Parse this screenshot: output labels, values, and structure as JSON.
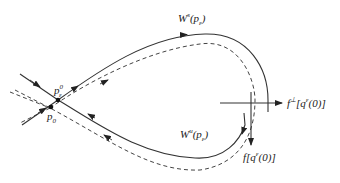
{
  "diagram": {
    "type": "homoclinic-orbit-perturbation",
    "colors": {
      "line": "#333333",
      "background": "#ffffff"
    },
    "labels": {
      "stable_manifold": {
        "base": "W",
        "sup": "s",
        "arg_base": "p",
        "arg_sub": "ε"
      },
      "unstable_manifold": {
        "base": "W",
        "sup": "u",
        "arg_base": "p",
        "arg_sub": "ε"
      },
      "perp_vector": {
        "base": "f",
        "sup": "⊥",
        "arg": "[q",
        "arg_sup": "ε",
        "tail": "(0)]"
      },
      "tangent_vector": {
        "base": "f",
        "arg": "[q",
        "arg_sup": "ε",
        "tail": "(0)]"
      },
      "perturbed_point": {
        "base": "p",
        "sub": "ε",
        "sup": "0"
      },
      "fixed_point": {
        "base": "p",
        "sub": "0"
      }
    },
    "legend": {
      "solid": "perturbed manifolds",
      "dashed": "unperturbed homoclinic orbit"
    }
  }
}
